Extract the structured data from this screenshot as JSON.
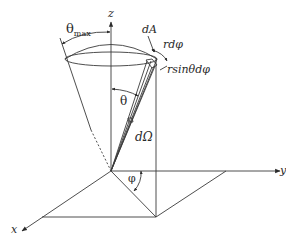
{
  "figure": {
    "colors": {
      "line": "#3a3a3a",
      "background": "#ffffff"
    }
  },
  "labels": {
    "theta_max": {
      "main": "θ",
      "sub": "max"
    },
    "z_axis": "z",
    "y_axis": "y",
    "x_axis": "x",
    "dA": "dA",
    "r_dphi": "rdφ",
    "r_sin_theta_dphi": "rsinθdφ",
    "theta": "θ",
    "d_omega": "dΩ",
    "phi": "φ"
  }
}
